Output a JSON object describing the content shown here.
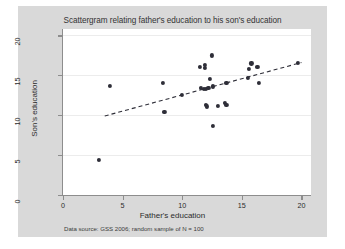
{
  "chart_data": {
    "type": "scatter",
    "title": "Scattergram relating father's education to his son's education",
    "xlabel": "Father's education",
    "ylabel": "Son's education",
    "xlim": [
      0,
      20.8
    ],
    "ylim": [
      0,
      20.8
    ],
    "xticks": [
      0,
      5,
      10,
      15,
      20
    ],
    "yticks": [
      0,
      5,
      10,
      15,
      20
    ],
    "grid": "horizontal",
    "legend": "none",
    "source_note": "Data source: GSS 2006; random sample of N = 100",
    "marker_color": "#2e2e38",
    "grid_color": "#ececec",
    "figure_background": "#d9d9d9",
    "plot_background": "#ffffff",
    "points": [
      {
        "x": 3.0,
        "y": 4.4
      },
      {
        "x": 3.9,
        "y": 13.7
      },
      {
        "x": 8.4,
        "y": 14.0
      },
      {
        "x": 8.5,
        "y": 10.4
      },
      {
        "x": 10.0,
        "y": 12.5
      },
      {
        "x": 11.5,
        "y": 16.0
      },
      {
        "x": 11.9,
        "y": 15.9
      },
      {
        "x": 11.9,
        "y": 16.3
      },
      {
        "x": 11.6,
        "y": 13.4
      },
      {
        "x": 11.8,
        "y": 13.3
      },
      {
        "x": 12.0,
        "y": 13.3
      },
      {
        "x": 12.2,
        "y": 13.4
      },
      {
        "x": 12.3,
        "y": 14.5
      },
      {
        "x": 12.5,
        "y": 17.5
      },
      {
        "x": 12.6,
        "y": 13.6
      },
      {
        "x": 12.0,
        "y": 11.3
      },
      {
        "x": 12.1,
        "y": 11.1
      },
      {
        "x": 12.6,
        "y": 8.7
      },
      {
        "x": 13.0,
        "y": 11.2
      },
      {
        "x": 13.6,
        "y": 11.5
      },
      {
        "x": 13.7,
        "y": 11.3
      },
      {
        "x": 13.7,
        "y": 14.0
      },
      {
        "x": 15.5,
        "y": 14.7
      },
      {
        "x": 15.6,
        "y": 15.8
      },
      {
        "x": 15.8,
        "y": 16.5
      },
      {
        "x": 16.3,
        "y": 16.0
      },
      {
        "x": 16.4,
        "y": 14.0
      },
      {
        "x": 19.7,
        "y": 16.6
      }
    ],
    "trend_line": {
      "style": "dashed",
      "color": "#2e2e38",
      "x0": 3.5,
      "y0": 9.9,
      "x1": 20.0,
      "y1": 16.6
    }
  }
}
